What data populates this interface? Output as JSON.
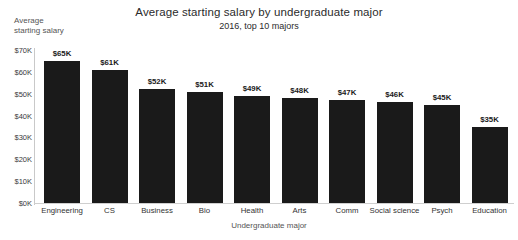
{
  "chart_data": {
    "type": "bar",
    "title": "Average starting salary by undergraduate major",
    "subtitle": "2016, top 10 majors",
    "xlabel": "Undergraduate major",
    "ylabel_lines": [
      "Average",
      "starting salary"
    ],
    "ylabel": "Average starting salary",
    "categories": [
      "Engineering",
      "CS",
      "Business",
      "Bio",
      "Health",
      "Arts",
      "Comm",
      "Social science",
      "Psych",
      "Education"
    ],
    "values": [
      65,
      61,
      52,
      51,
      49,
      48,
      47,
      46,
      45,
      35
    ],
    "value_labels": [
      "$65K",
      "$61K",
      "$52K",
      "$51K",
      "$49K",
      "$48K",
      "$47K",
      "$46K",
      "$45K",
      "$35K"
    ],
    "ylim": [
      0,
      70
    ],
    "ytick_values": [
      70,
      60,
      50,
      40,
      30,
      20,
      10,
      0
    ],
    "ytick_labels": [
      "$70K",
      "$60K",
      "$50K",
      "$40K",
      "$30K",
      "$20K",
      "$10K",
      "$0K"
    ],
    "grid": false,
    "legend": "none",
    "bar_color": "#1a1a1a",
    "background_color": "#ffffff",
    "axis_color": "#c9c9c9",
    "units": "thousands of US dollars"
  }
}
